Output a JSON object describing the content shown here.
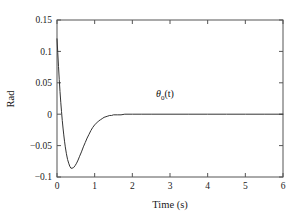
{
  "chart_data": {
    "type": "line",
    "title": "",
    "xlabel": "Time (s)",
    "ylabel": "Rad",
    "xlim": [
      0,
      6
    ],
    "ylim": [
      -0.1,
      0.15
    ],
    "xticks": [
      "0",
      "1",
      "2",
      "3",
      "4",
      "5",
      "6"
    ],
    "xtick_values": [
      0,
      1,
      2,
      3,
      4,
      5,
      6
    ],
    "yticks": [
      "0.15",
      "0.1",
      "0.05",
      "0",
      "−0.05",
      "−0.1"
    ],
    "ytick_values": [
      0.15,
      0.1,
      0.05,
      0,
      -0.05,
      -0.1
    ],
    "grid": false,
    "legend_position": "inline-annotation",
    "annotations": [
      {
        "name": "theta0-curve-label",
        "base": "θ",
        "subscript": "0",
        "suffix": "(t)",
        "x": 3.0,
        "y": 0.028
      }
    ],
    "series": [
      {
        "name": "θ₀(t)",
        "color": "#333333",
        "linewidth": 1,
        "x": [
          0.0,
          0.02,
          0.04,
          0.06,
          0.08,
          0.1,
          0.12,
          0.14,
          0.16,
          0.18,
          0.2,
          0.22,
          0.25,
          0.28,
          0.31,
          0.34,
          0.37,
          0.4,
          0.44,
          0.48,
          0.52,
          0.56,
          0.6,
          0.65,
          0.7,
          0.75,
          0.8,
          0.85,
          0.9,
          0.95,
          1.0,
          1.05,
          1.1,
          1.15,
          1.2,
          1.25,
          1.3,
          1.35,
          1.4,
          1.45,
          1.5,
          1.6,
          1.7,
          1.8,
          2.0,
          2.25,
          2.5,
          3.0,
          3.5,
          4.0,
          4.5,
          5.0,
          5.5,
          6.0
        ],
        "y": [
          0.12,
          0.098,
          0.076,
          0.055,
          0.036,
          0.019,
          0.004,
          -0.01,
          -0.022,
          -0.033,
          -0.043,
          -0.052,
          -0.063,
          -0.072,
          -0.078,
          -0.083,
          -0.086,
          -0.086,
          -0.085,
          -0.082,
          -0.078,
          -0.073,
          -0.067,
          -0.06,
          -0.052,
          -0.045,
          -0.038,
          -0.032,
          -0.026,
          -0.021,
          -0.017,
          -0.014,
          -0.011,
          -0.009,
          -0.007,
          -0.005,
          -0.004,
          -0.003,
          -0.002,
          -0.002,
          -0.001,
          -0.001,
          -0.001,
          0.0,
          0.0,
          0.0,
          0.0,
          0.0,
          0.0,
          0.0,
          0.0,
          0.0,
          0.0,
          0.0
        ]
      }
    ]
  },
  "axes": {
    "frame_color": "#555555",
    "tick_direction": "in"
  }
}
